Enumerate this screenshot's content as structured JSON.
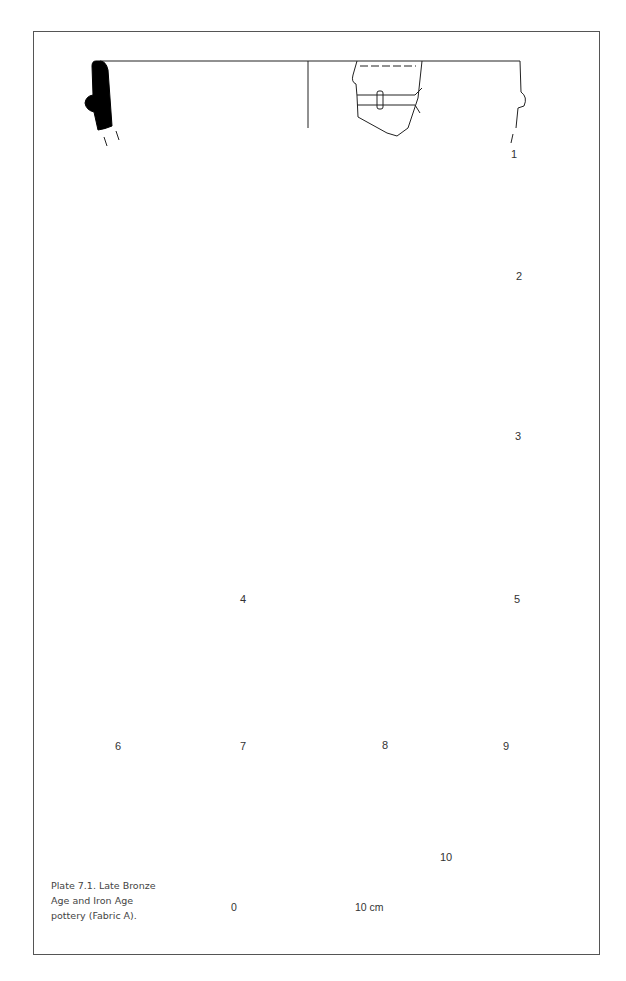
{
  "plate": {
    "caption_lines": [
      "Plate 7.1. Late Bronze",
      "Age and Iron Age",
      "pottery (Fabric A)."
    ],
    "caption": "Plate 7.1. Late Bronze Age and Iron Age pottery (Fabric A)."
  },
  "figures": [
    {
      "number": "1",
      "type": "rim-profile-with-cordon"
    },
    {
      "number": "2",
      "type": "rim-profile"
    },
    {
      "number": "3",
      "type": "rim-profile"
    },
    {
      "number": "4",
      "type": "rim-profile"
    },
    {
      "number": "5",
      "type": "rim-profile-decorated"
    },
    {
      "number": "6",
      "type": "rim-profile"
    },
    {
      "number": "7",
      "type": "body-sherd-decorated"
    },
    {
      "number": "8",
      "type": "body-sherd-decorated"
    },
    {
      "number": "9",
      "type": "body-sherd-decorated"
    },
    {
      "number": "10",
      "type": "rim-profile"
    }
  ],
  "scale_bar": {
    "start_label": "0",
    "end_label": "10 cm",
    "segments": 5
  },
  "colors": {
    "ink": "#000000",
    "line": "#222222",
    "frame": "#555555",
    "caption_text": "#444444"
  }
}
